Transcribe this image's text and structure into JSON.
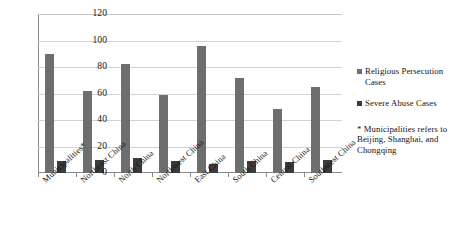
{
  "chart_data": {
    "type": "bar",
    "title": "",
    "subtitle": "",
    "xlabel": "",
    "ylabel": "",
    "ylim": [
      0,
      120
    ],
    "yticks": [
      0,
      20,
      40,
      60,
      80,
      100,
      120
    ],
    "grid": true,
    "legend_position": "right",
    "categories": [
      "Municipalities*",
      "Northeast China",
      "North China",
      "Northwest China",
      "East China",
      "South China",
      "Central China",
      "Southwest China"
    ],
    "series": [
      {
        "name": "Religious Persecution Cases",
        "color": "#6e6e6e",
        "values": [
          90,
          62,
          82,
          59,
          96,
          72,
          48,
          65
        ]
      },
      {
        "name": "Severe Abuse Cases",
        "color": "#3b3b3b",
        "values": [
          9,
          10,
          11,
          9,
          7,
          9,
          8,
          10
        ]
      }
    ],
    "annotations": [
      "* Municipalities refers to Beijing, Shanghai, and Chongqing"
    ]
  },
  "legend": {
    "entries": [
      {
        "label": "Religious Persecution Cases",
        "color": "#6e6e6e"
      },
      {
        "label": "Severe Abuse Cases",
        "color": "#3b3b3b"
      }
    ],
    "note": "* Municipalities refers to Beijing, Shanghai, and Chongqing"
  },
  "axis": {
    "y_ticks": [
      "0",
      "20",
      "40",
      "60",
      "80",
      "100",
      "120"
    ]
  }
}
